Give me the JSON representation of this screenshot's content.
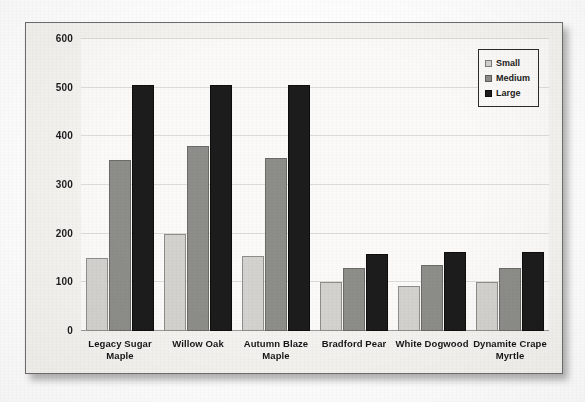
{
  "chart_data": {
    "type": "bar",
    "title": "",
    "xlabel": "",
    "ylabel": "",
    "ylim": [
      0,
      600
    ],
    "yticks": [
      0,
      100,
      200,
      300,
      400,
      500,
      600
    ],
    "ytick_labels": [
      "0",
      "100",
      "200",
      "300",
      "400",
      "500",
      "600"
    ],
    "grid": true,
    "legend_position": "top-right",
    "categories": [
      "Legacy Sugar Maple",
      "Willow Oak",
      "Autumn Blaze Maple",
      "Bradford Pear",
      "White Dogwood",
      "Dynamite Crape Myrtle"
    ],
    "series": [
      {
        "name": "Small",
        "color": "#d3d2ce",
        "values": [
          150,
          200,
          155,
          100,
          92,
          100
        ]
      },
      {
        "name": "Medium",
        "color": "#8d8d8a",
        "values": [
          352,
          380,
          355,
          130,
          135,
          130
        ]
      },
      {
        "name": "Large",
        "color": "#1c1c1c",
        "values": [
          505,
          505,
          505,
          158,
          163,
          163
        ]
      }
    ]
  },
  "legend": {
    "items": [
      {
        "label": "Small",
        "swatch": "legend-swatch-small"
      },
      {
        "label": "Medium",
        "swatch": "legend-swatch-medium"
      },
      {
        "label": "Large",
        "swatch": "legend-swatch-large"
      }
    ]
  },
  "colors": {
    "small": "#d3d2ce",
    "medium": "#8d8d8a",
    "large": "#1c1c1c",
    "frame_border": "#6d6d6d",
    "gridline": "#dedcd6",
    "axis": "#9a9a96",
    "plot_background": "#fbfaf8",
    "frame_background": "#f4f3f0"
  }
}
